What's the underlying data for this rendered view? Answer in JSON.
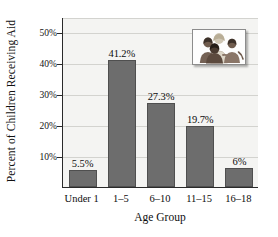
{
  "chart_data": {
    "type": "bar",
    "title": "",
    "subtitle": "",
    "xlabel": "Age Group",
    "ylabel": "Percent of Children Receiving Aid",
    "categories": [
      "Under 1",
      "1–5",
      "6–10",
      "11–15",
      "16–18"
    ],
    "values": [
      5.5,
      41.2,
      27.3,
      19.7,
      6
    ],
    "value_labels": [
      "5.5%",
      "41.2%",
      "27.3%",
      "19.7%",
      "6%"
    ],
    "ylim": [
      0,
      55
    ],
    "yticks": [
      10,
      20,
      30,
      40,
      50
    ],
    "ytick_labels": [
      "10%",
      "20%",
      "30%",
      "40%",
      "50%"
    ],
    "grid": true,
    "grid_axis": "y",
    "legend": "none",
    "bar_color": "#6d6d6d",
    "plot_background": "#f4f4f2",
    "axis_color": "#2a2a2a",
    "gridline_color": "#d3d3cf"
  },
  "inset": {
    "name": "children-photo",
    "caption": "",
    "border_color": "#8c8c8c"
  }
}
